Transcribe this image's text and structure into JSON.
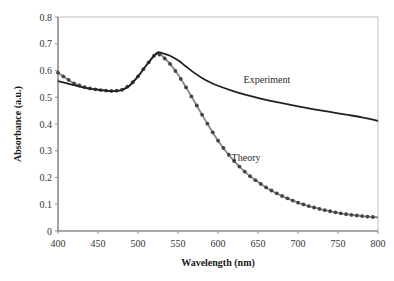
{
  "chart_data": {
    "type": "line",
    "title": "",
    "xlabel": "Wavelength (nm)",
    "ylabel": "Absorbance (a.u.)",
    "xlim": [
      400,
      800
    ],
    "ylim": [
      0,
      0.8
    ],
    "x_ticks": [
      400,
      450,
      500,
      550,
      600,
      650,
      700,
      750,
      800
    ],
    "y_ticks": [
      0,
      0.1,
      0.2,
      0.3,
      0.4,
      0.5,
      0.6,
      0.7,
      0.8
    ],
    "x_tick_labels": [
      "400",
      "450",
      "500",
      "550",
      "600",
      "650",
      "700",
      "750",
      "800"
    ],
    "y_tick_labels": [
      "0",
      "0.1",
      "0.2",
      "0.3",
      "0.4",
      "0.5",
      "0.6",
      "0.7",
      "0.8"
    ],
    "grid": false,
    "legend": "inline labels",
    "series": [
      {
        "name": "Experiment",
        "style": "solid dark line",
        "color": "#222222",
        "x": [
          400,
          420,
          440,
          460,
          470,
          480,
          490,
          500,
          510,
          520,
          525,
          530,
          540,
          550,
          560,
          570,
          580,
          590,
          600,
          620,
          640,
          660,
          680,
          700,
          720,
          740,
          760,
          780,
          800
        ],
        "values": [
          0.56,
          0.545,
          0.532,
          0.525,
          0.523,
          0.527,
          0.545,
          0.578,
          0.618,
          0.655,
          0.668,
          0.665,
          0.655,
          0.638,
          0.615,
          0.592,
          0.572,
          0.556,
          0.543,
          0.522,
          0.505,
          0.49,
          0.478,
          0.466,
          0.455,
          0.445,
          0.435,
          0.425,
          0.412
        ]
      },
      {
        "name": "Theory",
        "style": "gray line with dark dot markers",
        "color": "#888888",
        "marker_color": "#444444",
        "x": [
          400,
          410,
          420,
          430,
          440,
          450,
          460,
          470,
          480,
          490,
          500,
          510,
          520,
          525,
          530,
          540,
          550,
          560,
          570,
          580,
          590,
          600,
          610,
          620,
          630,
          640,
          650,
          660,
          670,
          680,
          690,
          700,
          710,
          720,
          730,
          740,
          750,
          760,
          770,
          780,
          790,
          800
        ],
        "values": [
          0.592,
          0.571,
          0.552,
          0.54,
          0.533,
          0.528,
          0.525,
          0.523,
          0.528,
          0.545,
          0.578,
          0.618,
          0.655,
          0.662,
          0.655,
          0.625,
          0.585,
          0.537,
          0.487,
          0.435,
          0.385,
          0.338,
          0.297,
          0.262,
          0.231,
          0.205,
          0.183,
          0.163,
          0.146,
          0.131,
          0.118,
          0.106,
          0.096,
          0.088,
          0.08,
          0.074,
          0.068,
          0.063,
          0.059,
          0.056,
          0.053,
          0.051
        ]
      }
    ],
    "annotations": [
      {
        "text": "Experiment",
        "x": 632,
        "y": 0.555
      },
      {
        "text": "Theory",
        "x": 617,
        "y": 0.26
      }
    ]
  }
}
